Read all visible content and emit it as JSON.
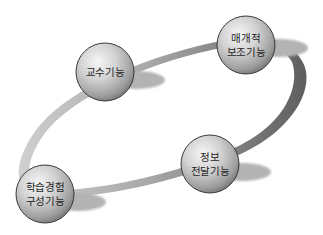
{
  "diagram": {
    "type": "cycle",
    "colors": {
      "background": "#ffffff",
      "ring_light": "#c4c4c4",
      "ring_dark": "#6a6a6a",
      "sphere_highlight": "#f2f2f2",
      "sphere_mid": "#c8c8c8",
      "sphere_edge": "#8a8a8a",
      "shadow": "#b0b0b0",
      "text": "#1e1e1e"
    },
    "nodes": [
      {
        "id": "teaching",
        "lines": [
          "교수기능"
        ],
        "cx": 105,
        "cy": 72
      },
      {
        "id": "mediating",
        "lines": [
          "매개적",
          "보조기능"
        ],
        "cx": 246,
        "cy": 45
      },
      {
        "id": "info",
        "lines": [
          "정보",
          "전달기능"
        ],
        "cx": 210,
        "cy": 164
      },
      {
        "id": "learning",
        "lines": [
          "학습경험",
          "구성기능"
        ],
        "cx": 45,
        "cy": 194
      }
    ]
  }
}
